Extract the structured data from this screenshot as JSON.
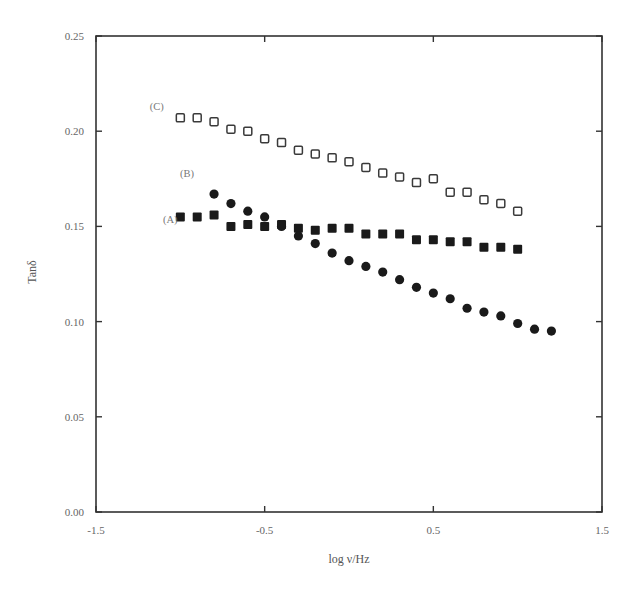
{
  "chart_data": {
    "type": "scatter",
    "title": "",
    "xlabel": "log ν/Hz",
    "ylabel": "Tanδ",
    "xlim": [
      -1.5,
      1.5
    ],
    "ylim": [
      0.0,
      0.25
    ],
    "grid": false,
    "legend": "inline labels (A), (B), (C) at left of each series",
    "x_ticks": [
      "-1.5",
      "-0.5",
      "0.5",
      "1.5"
    ],
    "y_ticks": [
      "0.00",
      "0.05",
      "0.10",
      "0.15",
      "0.20",
      "0.25"
    ],
    "series": [
      {
        "name": "(A)",
        "marker": "filled-square",
        "x": [
          -1.0,
          -0.9,
          -0.8,
          -0.7,
          -0.6,
          -0.5,
          -0.4,
          -0.3,
          -0.2,
          -0.1,
          0.0,
          0.1,
          0.2,
          0.3,
          0.4,
          0.5,
          0.6,
          0.7,
          0.8,
          0.9,
          1.0
        ],
        "values": [
          0.155,
          0.155,
          0.156,
          0.15,
          0.151,
          0.15,
          0.151,
          0.149,
          0.148,
          0.149,
          0.149,
          0.146,
          0.146,
          0.146,
          0.143,
          0.143,
          0.142,
          0.142,
          0.139,
          0.139,
          0.138
        ]
      },
      {
        "name": "(B)",
        "marker": "filled-circle",
        "x": [
          -0.8,
          -0.7,
          -0.6,
          -0.5,
          -0.4,
          -0.3,
          -0.2,
          -0.1,
          0.0,
          0.1,
          0.2,
          0.3,
          0.4,
          0.5,
          0.6,
          0.7,
          0.8,
          0.9,
          1.0,
          1.1,
          1.2
        ],
        "values": [
          0.167,
          0.162,
          0.158,
          0.155,
          0.15,
          0.145,
          0.141,
          0.136,
          0.132,
          0.129,
          0.126,
          0.122,
          0.118,
          0.115,
          0.112,
          0.107,
          0.105,
          0.103,
          0.099,
          0.096,
          0.095
        ]
      },
      {
        "name": "(C)",
        "marker": "open-square",
        "x": [
          -1.0,
          -0.9,
          -0.8,
          -0.7,
          -0.6,
          -0.5,
          -0.4,
          -0.3,
          -0.2,
          -0.1,
          0.0,
          0.1,
          0.2,
          0.3,
          0.4,
          0.5,
          0.6,
          0.7,
          0.8,
          0.9,
          1.0
        ],
        "values": [
          0.207,
          0.207,
          0.205,
          0.201,
          0.2,
          0.196,
          0.194,
          0.19,
          0.188,
          0.186,
          0.184,
          0.181,
          0.178,
          0.176,
          0.173,
          0.175,
          0.168,
          0.168,
          0.164,
          0.162,
          0.158
        ]
      }
    ],
    "annotations": [
      {
        "text": "(C)",
        "x": -1.14,
        "y": 0.213
      },
      {
        "text": "(B)",
        "x": -0.96,
        "y": 0.178
      },
      {
        "text": "(A)",
        "x": -1.06,
        "y": 0.154
      }
    ]
  },
  "colors": {
    "axis": "#333333",
    "marker": "#1a1a1a",
    "text": "#666666"
  }
}
